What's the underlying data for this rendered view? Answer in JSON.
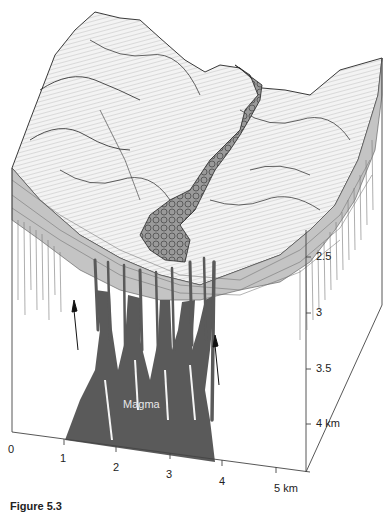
{
  "figure": {
    "caption": "Figure 5.3",
    "magma_label": "Magma",
    "colors": {
      "magma": "#5a5a5a",
      "strata": "#bdbdbd",
      "terrain_line": "#333333",
      "background": "#ffffff",
      "axis": "#444444"
    },
    "horizontal_axis": {
      "unit": "km",
      "ticks": [
        "0",
        "1",
        "2",
        "3",
        "4",
        "5 km"
      ]
    },
    "vertical_axis": {
      "unit": "km",
      "ticks": [
        "2.5",
        "3",
        "3.5",
        "4 km"
      ]
    },
    "features": [
      "terrain-surface",
      "lava-flow",
      "stratified-layers",
      "dikes",
      "magma-chamber",
      "flow-arrows"
    ]
  }
}
